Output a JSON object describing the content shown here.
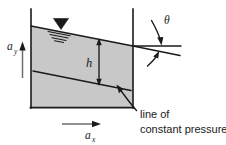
{
  "figure": {
    "type": "technical-diagram",
    "background_color": "#ffffff",
    "fluid_fill_color": "#c8c8c8",
    "line_color": "#1a1a1a"
  },
  "labels": {
    "depth": "h",
    "accel_vertical": "a",
    "accel_vertical_sub": "y",
    "accel_horizontal": "a",
    "accel_horizontal_sub": "x",
    "angle": "θ",
    "annotation_line1": "line of",
    "annotation_line2": "constant pressure"
  },
  "elements": {
    "container": "open-top rectangular tank with vertical left and right walls and a horizontal base",
    "free_surface": "inclined straight free surface sloping downward to the right",
    "free_surface_marker": "downward filled triangle with horizontal hatch lines",
    "isobar": "interior straight line parallel to the free surface",
    "depth_dimension": "vertical double-headed arrow labelled h",
    "angle_marker": "two curved arrows indicating the angle between the horizontal reference line and the inclined free surface",
    "horizontal_reference": "horizontal line extending right from the right wall",
    "leader": "curved leader line from the isobar to the annotation text"
  },
  "geometry": {
    "tank_left_x": 30,
    "tank_right_x": 134,
    "tank_top_y": 9,
    "tank_bottom_y": 108,
    "surface_left_y": 26,
    "surface_right_y": 46,
    "isobar_left_y": 71,
    "isobar_right_y": 91,
    "depth_arrow_x": 99,
    "angle_vertex_x": 134,
    "angle_vertex_y": 46
  }
}
